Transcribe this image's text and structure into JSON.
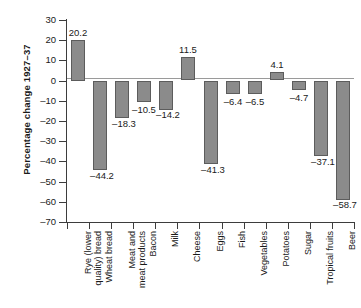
{
  "chart_data": {
    "type": "bar",
    "title": "",
    "subtitle": "",
    "xlabel": "",
    "ylabel": "Percentage change 1927–37",
    "ylim": [
      -70,
      30
    ],
    "ytick_step": 10,
    "grid": false,
    "legend": "none",
    "bar_color": "#8b8b8b",
    "bar_border_color": "#5c5c5c",
    "axis_color": "#3d3d3d",
    "zero_line_color": "#9a9a9a",
    "categories": [
      "Rye (lower quality) bread",
      "Wheat bread",
      "Meat and meat products",
      "Bacon",
      "Milk",
      "Cheese",
      "Eggs",
      "Fish",
      "Vegetables",
      "Potatoes",
      "Sugar",
      "Tropical fruits",
      "Beer"
    ],
    "category_lines": [
      [
        "Rye (lower",
        "quality) bread"
      ],
      [
        "Wheat bread"
      ],
      [
        "Meat and",
        "meat products"
      ],
      [
        "Bacon"
      ],
      [
        "Milk"
      ],
      [
        "Cheese"
      ],
      [
        "Eggs"
      ],
      [
        "Fish"
      ],
      [
        "Vegetables"
      ],
      [
        "Potatoes"
      ],
      [
        "Sugar"
      ],
      [
        "Tropical fruits"
      ],
      [
        "Beer"
      ]
    ],
    "values": [
      20.2,
      -44.2,
      -18.3,
      -10.5,
      -14.2,
      11.5,
      -41.3,
      -6.4,
      -6.5,
      4.1,
      -4.7,
      -37.1,
      -58.7
    ],
    "value_labels": [
      "20.2",
      "–44.2",
      "–18.3",
      "–10.5",
      "–14.2",
      "11.5",
      "–41.3",
      "–6.4",
      "–6.5",
      "4.1",
      "–4.7",
      "–37.1",
      "–58.7"
    ],
    "ytick_labels": [
      "30",
      "20",
      "10",
      "0",
      "–10",
      "–20",
      "–30",
      "–40",
      "–50",
      "–60",
      "–70"
    ],
    "ytick_values": [
      30,
      20,
      10,
      0,
      -10,
      -20,
      -30,
      -40,
      -50,
      -60,
      -70
    ]
  }
}
